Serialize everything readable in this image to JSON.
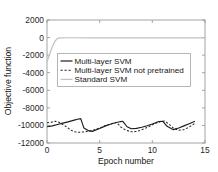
{
  "chart_data": {
    "type": "line",
    "title": "",
    "xlabel": "Epoch number",
    "ylabel": "Objective function",
    "xlim": [
      0,
      15
    ],
    "ylim": [
      -12000,
      2000
    ],
    "xticks": [
      0,
      5,
      10,
      15
    ],
    "xtick_labels": [
      "0",
      "5",
      "10",
      "15"
    ],
    "yticks": [
      2000,
      0,
      -2000,
      -4000,
      -6000,
      -8000,
      -10000,
      -12000
    ],
    "ytick_labels": [
      "2000",
      "0",
      "-2000",
      "-4000",
      "-6000",
      "-8000",
      "-10000",
      "-12000"
    ],
    "grid": false,
    "legend_position": "upper-center",
    "series": [
      {
        "name": "Multi-layer SVM",
        "style": "solid",
        "color": "#1c1c1c",
        "x": [
          0.0,
          0.5,
          1.0,
          1.5,
          2.0,
          2.5,
          3.0,
          3.2,
          3.5,
          4.0,
          4.3,
          5.0,
          5.5,
          6.0,
          6.5,
          7.0,
          7.2,
          7.6,
          8.0,
          8.5,
          9.0,
          9.5,
          10.0,
          10.6,
          11.0,
          11.4,
          12.0,
          12.5,
          13.0,
          13.5,
          14.0
        ],
        "y": [
          -10150,
          -10050,
          -9900,
          -9740,
          -9590,
          -9430,
          -9270,
          -9230,
          -10280,
          -10620,
          -10680,
          -10340,
          -10080,
          -9860,
          -9700,
          -9560,
          -9530,
          -10150,
          -10380,
          -10340,
          -10200,
          -10030,
          -9830,
          -9560,
          -9530,
          -10100,
          -10480,
          -10300,
          -10050,
          -9800,
          -9550
        ]
      },
      {
        "name": "Multi-layer SVM not pretrained",
        "style": "dashed",
        "color": "#2a2a2a",
        "x": [
          0.0,
          0.4,
          0.8,
          1.2,
          1.6,
          2.0,
          2.3,
          2.6,
          3.0,
          3.5,
          4.0,
          4.5,
          5.0,
          5.4,
          5.8,
          6.2,
          6.6,
          7.0,
          7.5,
          8.0,
          8.4,
          8.8,
          9.2,
          9.6,
          10.0,
          10.4,
          10.8,
          11.2,
          11.6,
          12.0,
          12.5,
          13.0,
          13.5,
          14.0
        ],
        "y": [
          -9700,
          -9640,
          -9520,
          -9680,
          -9960,
          -10290,
          -10560,
          -10720,
          -10780,
          -10740,
          -10640,
          -10490,
          -10280,
          -10100,
          -9930,
          -9780,
          -9660,
          -10180,
          -10560,
          -10720,
          -10700,
          -10580,
          -10400,
          -10170,
          -9930,
          -9720,
          -9560,
          -9500,
          -9880,
          -10300,
          -10560,
          -10480,
          -10180,
          -9800
        ]
      },
      {
        "name": "Standard SVM",
        "style": "solid-gray",
        "color": "#c2c2c2",
        "x": [
          0.0,
          0.25,
          0.5,
          0.75,
          1.0,
          1.3,
          2.0,
          4.0,
          7.0,
          10.0,
          13.0,
          15.0
        ],
        "y": [
          -2760,
          -1900,
          -1050,
          -420,
          -90,
          -30,
          -20,
          -20,
          -20,
          -20,
          -20,
          -20
        ]
      }
    ]
  },
  "legend": {
    "entries": [
      {
        "label": "Multi-layer SVM",
        "style": "solid"
      },
      {
        "label": "Multi-layer SVM not pretrained",
        "style": "dashed"
      },
      {
        "label": "Standard SVM",
        "style": "solid-gray"
      }
    ]
  }
}
